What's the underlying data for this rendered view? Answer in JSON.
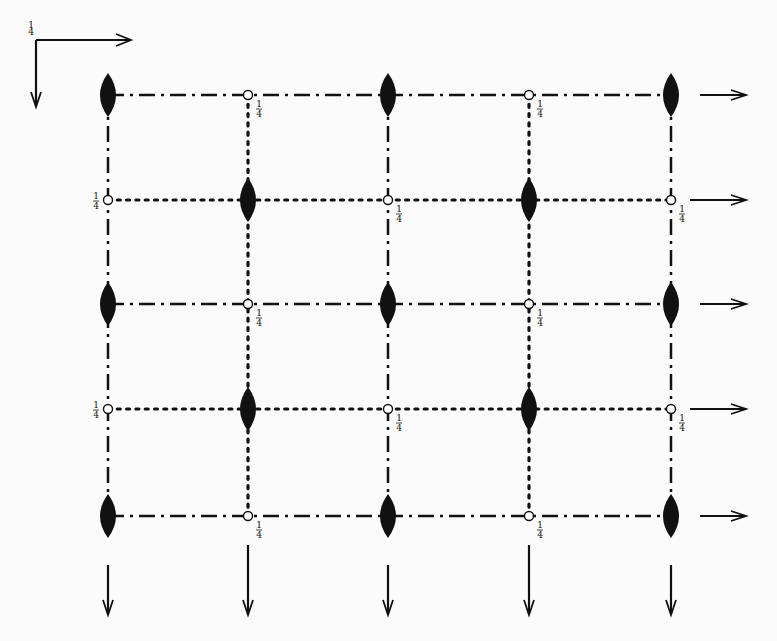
{
  "diagram": {
    "title": "",
    "origin_label": "1/4",
    "fraction_label": "1/4",
    "columns_x": [
      108,
      248,
      388,
      529,
      671
    ],
    "rows_y": [
      95,
      200,
      304,
      409,
      516
    ],
    "colors": {
      "ink": "#111111",
      "background": "#fbfbfb"
    },
    "legend": {
      "axis_right": "arrow-right",
      "axis_down": "arrow-down",
      "filled_lens": "two-fold screw axis (filled lens)",
      "open_circle": "inversion centre at height 1/4",
      "dash_dot_line": "glide plane",
      "dotted_line": "glide plane (dotted)"
    }
  }
}
